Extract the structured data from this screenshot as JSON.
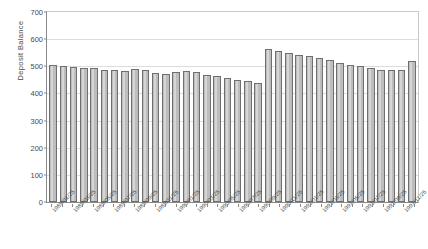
{
  "chart_data": {
    "type": "bar",
    "title": "",
    "xlabel": "",
    "ylabel": "Deposit Balance",
    "ylim": [
      0,
      700
    ],
    "ytick_step": 100,
    "yticks": [
      0,
      100,
      200,
      300,
      400,
      500,
      600,
      700
    ],
    "grid": true,
    "legend": false,
    "bar_color": "#bdbdbd",
    "bar_edge_color": "#6f6f6f",
    "gridline_color": "#dcdcdc",
    "axis_color": "#8a8a8a",
    "background": "#ffffff",
    "xtick_rotation": -45,
    "xtick_label_interval": 2,
    "categories": [
      "1989/01/25",
      "1989/02/25",
      "1989/03/25",
      "1989/04/25",
      "1989/05/25",
      "1989/06/25",
      "1989/07/25",
      "1989/08/25",
      "1989/09/25",
      "1989/10/25",
      "1989/11/25",
      "1989/12/25",
      "1990/01/25",
      "1990/02/25",
      "1990/03/25",
      "1990/04/25",
      "1990/05/25",
      "1990/06/25",
      "1990/07/25",
      "1990/08/25",
      "1990/09/25",
      "1990/10/25",
      "1990/11/25",
      "1990/12/25",
      "1991/01/25",
      "1991/02/25",
      "1991/03/25",
      "1991/04/25",
      "1991/05/25",
      "1991/06/25",
      "1991/07/25",
      "1991/08/25",
      "1991/09/25",
      "1991/10/25",
      "1991/11/25",
      "1991/12/25"
    ],
    "values": [
      503,
      500,
      497,
      494,
      492,
      488,
      486,
      484,
      491,
      488,
      474,
      473,
      478,
      482,
      479,
      468,
      464,
      458,
      450,
      445,
      440,
      565,
      556,
      548,
      542,
      538,
      530,
      522,
      512,
      505,
      500,
      494,
      488,
      485,
      486,
      520
    ]
  }
}
